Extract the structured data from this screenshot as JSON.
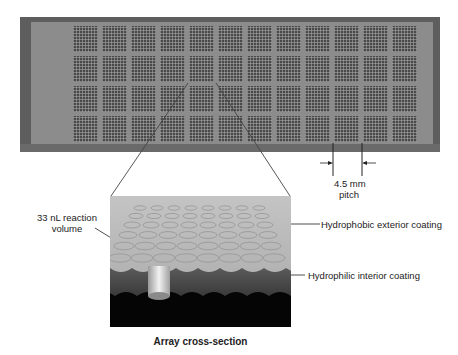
{
  "figure": {
    "slide": {
      "block_columns": 12,
      "block_rows": 4,
      "colors": {
        "frame": "#5e5e5e",
        "surface": "#8c8c8c",
        "wells": "#4a4a4a"
      }
    },
    "pitch_label": {
      "line1": "4.5 mm",
      "line2": "pitch"
    },
    "callouts": {
      "reaction_volume": {
        "line1": "33 nL reaction",
        "line2": "volume"
      },
      "hydrophobic": "Hydrophobic exterior coating",
      "hydrophilic": "Hydrophilic interior coating"
    },
    "caption": "Array cross-section"
  }
}
